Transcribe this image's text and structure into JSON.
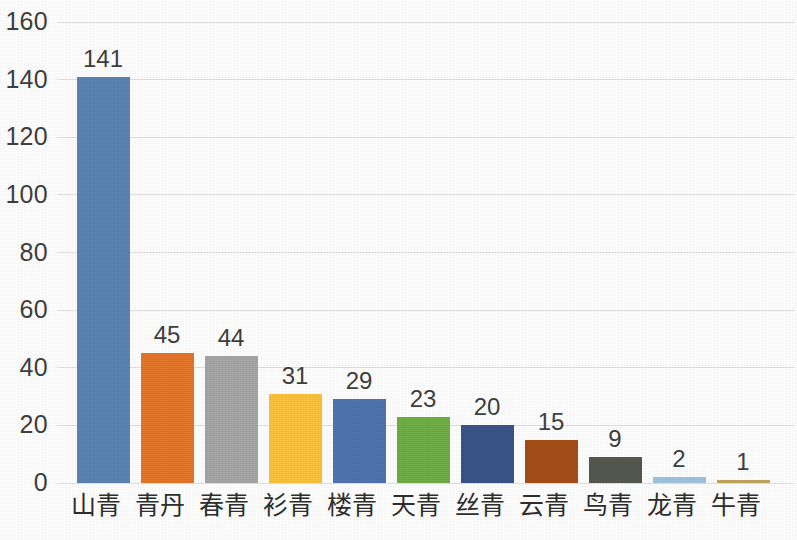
{
  "chart_data": {
    "type": "bar",
    "title": "",
    "subtitle": "",
    "xlabel": "",
    "ylabel": "",
    "ylim": [
      0,
      160
    ],
    "ytick_step": 20,
    "yticks": [
      "0",
      "20",
      "40",
      "60",
      "80",
      "100",
      "120",
      "140",
      "160"
    ],
    "grid": true,
    "legend": "none",
    "categories": [
      "青山",
      "丹青",
      "青春",
      "青衫",
      "青楼",
      "青天",
      "青丝",
      "青云",
      "青鸟",
      "青龙",
      "青牛"
    ],
    "values": [
      141,
      45,
      44,
      31,
      29,
      23,
      20,
      15,
      9,
      2,
      1
    ],
    "value_labels": [
      "141",
      "45",
      "44",
      "31",
      "29",
      "23",
      "20",
      "15",
      "9",
      "2",
      "1"
    ],
    "bar_colors": [
      "#5B84B1",
      "#E3762B",
      "#A5A5A5",
      "#F9C councils"
    ]
  },
  "palette": {
    "bars": [
      "#5B84B1",
      "#E3762B",
      "#A5A5A5",
      "#FAC13C",
      "#4F74AE",
      "#70AD47",
      "#3B5488",
      "#A54D19",
      "#55584E",
      "#9FC3DE",
      "#BFA35C"
    ],
    "gridline": "#e2e2e2",
    "axis_text": "#3f3f3f",
    "label_text": "#2e2e2e",
    "background": "#ffffff"
  },
  "layout": {
    "plot_left": 57,
    "plot_top": 22,
    "plot_width": 738,
    "plot_height": 461,
    "bar_width": 53,
    "bar_pitch": 64,
    "first_bar_center": 103
  }
}
